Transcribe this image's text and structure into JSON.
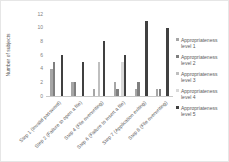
{
  "chart": {
    "ylabel": "Number of subjects"
  },
  "chart_data": {
    "type": "bar",
    "title": "",
    "xlabel": "",
    "ylabel": "Number of subjects",
    "ylim": [
      0,
      12
    ],
    "yticks": [
      0,
      2,
      4,
      6,
      8,
      10,
      12
    ],
    "grid": false,
    "legend_position": "right",
    "categories": [
      "Step 1 (Invalid password)",
      "Step 2 (Failure to open a file)",
      "Step 4 (File overwriting)",
      "Step 6 (Failure to insert a file)",
      "Step 7 (Application exiting)",
      "Step 8 (File overwriting)"
    ],
    "series": [
      {
        "name": "Appropriateness level 1",
        "color": "#a6a6a6",
        "values": [
          4,
          2,
          1,
          2,
          1,
          1
        ]
      },
      {
        "name": "Appropriateness level 2",
        "color": "#7f7f7f",
        "values": [
          5,
          2,
          0,
          1,
          2,
          1
        ]
      },
      {
        "name": "Appropriateness level 3",
        "color": "#bfbfbf",
        "values": [
          0,
          0,
          5,
          0,
          0,
          0
        ]
      },
      {
        "name": "Appropriateness level 4",
        "color": "#d9d9d9",
        "values": [
          0,
          0,
          0,
          5,
          0,
          0
        ]
      },
      {
        "name": "Appropriateness level 5",
        "color": "#404040",
        "values": [
          6,
          5,
          8,
          6,
          11,
          10
        ]
      }
    ]
  }
}
